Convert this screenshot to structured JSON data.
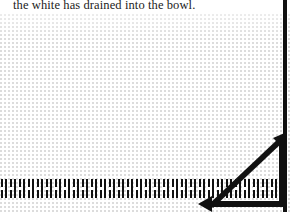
{
  "page": {
    "width": 291,
    "height": 212,
    "background_color": "#ffffff",
    "ink_color": "#111111",
    "halftone_dot_color": "#dcdcdc"
  },
  "caption": {
    "text": "the white has drained into the bowl.",
    "color": "#1b1b1b"
  },
  "right_rule": {
    "name": "vertical-rule",
    "color": "#111111"
  },
  "hatch_row": {
    "name": "hatch-mark-row",
    "glyph": "II",
    "count": 31,
    "color": "#111111"
  },
  "wedge": {
    "name": "wedge-diagram",
    "baseline_label": "",
    "diagonal_label": "",
    "arrow_up_right": "arrow-up-right",
    "arrow_left": "arrow-left",
    "color": "#111111"
  }
}
